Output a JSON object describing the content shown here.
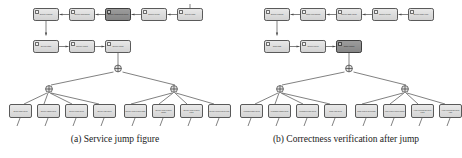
{
  "figure": {
    "background_color": "#ffffff",
    "node_fill": "#dcdcdc",
    "node_highlight_fill": "#8f8f8f",
    "node_stroke": "#5a5a5a",
    "edge_color": "#4a4a4a",
    "caption_color": "#1a1a1a"
  },
  "subfigures": [
    {
      "id": "a",
      "caption": "(a) Service jump figure",
      "highlight": {
        "row": 1,
        "index": 3
      },
      "process_row1": [
        {
          "label": "Service request"
        },
        {
          "label": "Service scheduling"
        },
        {
          "label": "Service component select"
        },
        {
          "label": "Service invoke"
        },
        {
          "label": "Service jump"
        }
      ],
      "process_row2": [
        {
          "label": "Service state"
        },
        {
          "label": "Service output"
        },
        {
          "label": "Service return"
        }
      ],
      "gates": [
        {
          "name": "root-gate",
          "symbol": "+"
        },
        {
          "name": "left-gate",
          "symbol": "+"
        },
        {
          "name": "right-gate",
          "symbol": "+"
        }
      ],
      "leaves_left": [
        {
          "label": "Service state check"
        },
        {
          "label": "Service param check"
        },
        {
          "label": "Service result check"
        },
        {
          "label": "Service logic check"
        }
      ],
      "leaves_right": [
        {
          "label": "Service context check state"
        },
        {
          "label": "Service context check param"
        },
        {
          "label": "Service context check result"
        },
        {
          "label": "Service context check logic"
        }
      ]
    },
    {
      "id": "b",
      "caption": "(b) Correctness verification after jump",
      "highlight": {
        "row": 2,
        "index": 3
      },
      "process_row1": [
        {
          "label": "Service request"
        },
        {
          "label": "Jump correctness"
        },
        {
          "label": "Service state check"
        },
        {
          "label": "Service invoke"
        },
        {
          "label": "Service jump verify"
        }
      ],
      "process_row2": [
        {
          "label": "Jump state"
        },
        {
          "label": "Service check"
        },
        {
          "label": "Jump verified"
        }
      ],
      "gates": [
        {
          "name": "root-gate",
          "symbol": "+"
        },
        {
          "name": "left-gate",
          "symbol": "+"
        },
        {
          "name": "right-gate",
          "symbol": "+"
        }
      ],
      "leaves_left": [
        {
          "label": "Verification state check"
        },
        {
          "label": "Verification param check"
        },
        {
          "label": "Verification result check"
        },
        {
          "label": "Jump logic check"
        }
      ],
      "leaves_right": [
        {
          "label": "Jump context check state"
        },
        {
          "label": "Verify context check param"
        },
        {
          "label": "Verify correctness check result"
        },
        {
          "label": "Verify correctness check logic"
        }
      ]
    }
  ]
}
